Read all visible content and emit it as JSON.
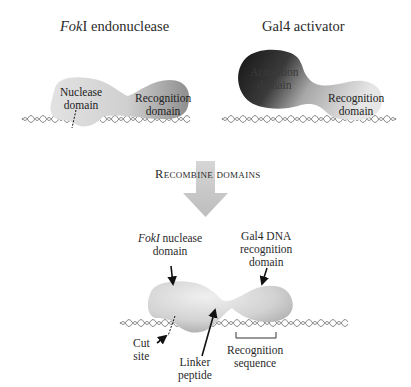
{
  "panels": {
    "fokI": {
      "title_italic": "Fok",
      "title_rest": "I endonuclease",
      "nuclease_label_line1": "Nuclease",
      "nuclease_label_line2": "domain",
      "recognition_label_line1": "Recognition",
      "recognition_label_line2": "domain"
    },
    "gal4": {
      "title": "Gal4 activator",
      "activation_label_line1": "Activation",
      "activation_label_line2": "domain",
      "recognition_label_line1": "Recognition",
      "recognition_label_line2": "domain"
    }
  },
  "arrow": {
    "label": "Recombine domains"
  },
  "hybrid": {
    "nuclease_label_italic": "FokI",
    "nuclease_label_rest": " nuclease",
    "nuclease_label_line2": "domain",
    "recognition_label_line1": "Gal4 DNA",
    "recognition_label_line2": "recognition",
    "recognition_label_line3": "domain",
    "cut_site_line1": "Cut",
    "cut_site_line2": "site",
    "linker_line1": "Linker",
    "linker_line2": "peptide",
    "recog_seq_line1": "Recognition",
    "recog_seq_line2": "sequence"
  },
  "colors": {
    "protein_light": "#d9d9d9",
    "protein_dark": "#1a1a1a",
    "arrow_fill": "#c8c8c8",
    "dna": "#8a8a8a"
  }
}
